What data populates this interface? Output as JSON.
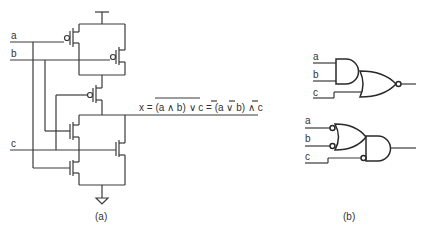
{
  "figure_a": {
    "inputs": [
      "a",
      "b",
      "c"
    ],
    "output_equation_parts": {
      "lhs": "x = ",
      "overlined": "(a ∧ b) ∨ c",
      "eq2": " = (",
      "a": "a",
      "or": " ∨ ",
      "b": "b",
      "and_close": ") ∧ ",
      "c": "c"
    },
    "caption": "(a)"
  },
  "figure_b": {
    "top_circuit_inputs": [
      "a",
      "b",
      "c"
    ],
    "bottom_circuit_inputs": [
      "a",
      "b",
      "c"
    ],
    "caption": "(b)"
  },
  "colors": {
    "line": "#3a3a3a",
    "text": "#333333",
    "background": "#ffffff"
  }
}
